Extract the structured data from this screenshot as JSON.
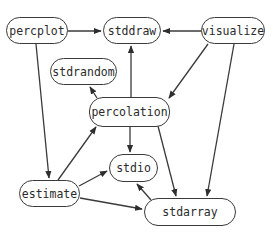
{
  "diagram": {
    "type": "dependency-graph",
    "nodes": [
      {
        "id": "percplot",
        "label": "percplot",
        "x": 6,
        "y": 17,
        "w": 62,
        "h": 27
      },
      {
        "id": "stddraw",
        "label": "stddraw",
        "x": 103,
        "y": 17,
        "w": 58,
        "h": 27
      },
      {
        "id": "visualize",
        "label": "visualize",
        "x": 201,
        "y": 17,
        "w": 64,
        "h": 27
      },
      {
        "id": "stdrandom",
        "label": "stdrandom",
        "x": 50,
        "y": 58,
        "w": 67,
        "h": 27
      },
      {
        "id": "percolation",
        "label": "percolation",
        "x": 89,
        "y": 97,
        "w": 81,
        "h": 30
      },
      {
        "id": "stdio",
        "label": "stdio",
        "x": 109,
        "y": 154,
        "w": 49,
        "h": 28
      },
      {
        "id": "estimate",
        "label": "estimate",
        "x": 19,
        "y": 180,
        "w": 61,
        "h": 27
      },
      {
        "id": "stdarray",
        "label": "stdarray",
        "x": 144,
        "y": 198,
        "w": 92,
        "h": 28
      }
    ],
    "edges": [
      {
        "from": "percplot",
        "to": "stddraw",
        "x1": 68,
        "y1": 31,
        "x2": 101,
        "y2": 31
      },
      {
        "from": "visualize",
        "to": "stddraw",
        "x1": 201,
        "y1": 31,
        "x2": 163,
        "y2": 31
      },
      {
        "from": "percolation",
        "to": "stddraw",
        "x1": 131,
        "y1": 97,
        "x2": 131,
        "y2": 46
      },
      {
        "from": "percolation",
        "to": "stdrandom",
        "x1": 97,
        "y1": 98,
        "x2": 90,
        "y2": 87
      },
      {
        "from": "visualize",
        "to": "percolation",
        "x1": 208,
        "y1": 44,
        "x2": 169,
        "y2": 98
      },
      {
        "from": "percplot",
        "to": "estimate",
        "x1": 36,
        "y1": 44,
        "x2": 49,
        "y2": 178
      },
      {
        "from": "estimate",
        "to": "percolation",
        "x1": 58,
        "y1": 180,
        "x2": 96,
        "y2": 127
      },
      {
        "from": "percolation",
        "to": "stdio",
        "x1": 130,
        "y1": 127,
        "x2": 130,
        "y2": 152
      },
      {
        "from": "percolation",
        "to": "stdarray",
        "x1": 158,
        "y1": 126,
        "x2": 176,
        "y2": 196
      },
      {
        "from": "visualize",
        "to": "stdarray",
        "x1": 234,
        "y1": 44,
        "x2": 207,
        "y2": 196
      },
      {
        "from": "estimate",
        "to": "stdio",
        "x1": 79,
        "y1": 186,
        "x2": 107,
        "y2": 171
      },
      {
        "from": "estimate",
        "to": "stdarray",
        "x1": 80,
        "y1": 198,
        "x2": 142,
        "y2": 209
      },
      {
        "from": "stdarray",
        "to": "stdio",
        "x1": 151,
        "y1": 200,
        "x2": 137,
        "y2": 184
      }
    ],
    "colors": {
      "stroke": "#3a3a3a",
      "text": "#2b2b2b",
      "background": "#ffffff"
    }
  }
}
